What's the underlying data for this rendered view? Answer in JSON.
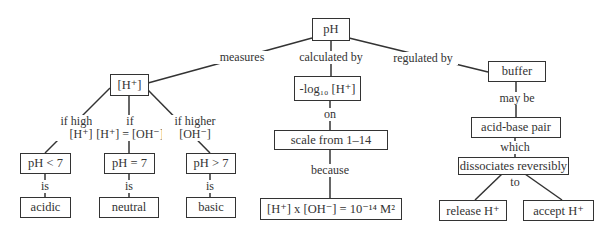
{
  "nodes": {
    "ph": "pH",
    "h_ion": "[H⁺]",
    "neglog": "-log₁₀ [H⁺]",
    "buffer": "buffer",
    "acid_base_pair": "acid-base pair",
    "dissociates": "dissociates reversibly",
    "release": "release H⁺",
    "accept": "accept H⁺",
    "scale": "scale from 1–14",
    "equation": "[H⁺] x [OH⁻] = 10⁻¹⁴ M²",
    "ph_lt7": "pH < 7",
    "ph_eq7": "pH = 7",
    "ph_gt7": "pH > 7",
    "acidic": "acidic",
    "neutral": "neutral",
    "basic": "basic"
  },
  "links": {
    "measures": "measures",
    "calculated_by": "calculated by",
    "regulated_by": "regulated by",
    "if_higher_h_1": "if higher",
    "if_higher_h_2": "[H⁺]",
    "if_eq_1": "if",
    "if_eq_2": "[H⁺] = [OH⁻]",
    "if_higher_oh_1": "if higher",
    "if_higher_oh_2": "[OH⁻]",
    "is_1": "is",
    "is_2": "is",
    "is_3": "is",
    "on": "on",
    "because": "because",
    "may_be": "may be",
    "which": "which",
    "to": "to"
  }
}
